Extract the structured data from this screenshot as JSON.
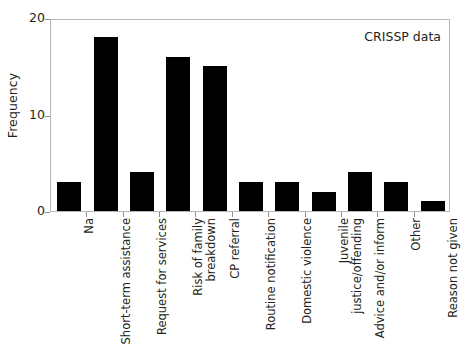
{
  "chart_data": {
    "type": "bar",
    "title": "",
    "subtitle": "",
    "annotation": "CRISSP data",
    "xlabel": "",
    "ylabel": "Frequency",
    "ylim": [
      0,
      20
    ],
    "yticks": [
      0,
      10,
      20
    ],
    "ytick_labels": [
      "0",
      "10",
      "20"
    ],
    "grid": false,
    "legend": null,
    "bar_color": "#000000",
    "frame_color": "#b8b8b8",
    "text_color": "#231f20",
    "categories": [
      "Na",
      "Short-term assistance",
      "Request for services",
      "Risk of family\nbreakdown",
      "CP referral",
      "Routine notification",
      "Domestic violence",
      "Juvenile\njustice/offending",
      "Advice and/or inform",
      "Other",
      "Reason not given"
    ],
    "values": [
      3,
      18,
      4,
      16,
      15,
      3,
      3,
      2,
      4,
      3,
      1
    ]
  }
}
